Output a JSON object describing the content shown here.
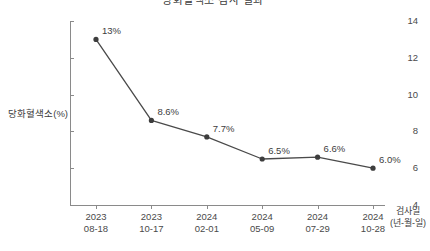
{
  "chart_data": {
    "type": "line",
    "title": "당화혈색소 검사 결과",
    "xlabel": "검사일",
    "xlabel_sub": "(년-월-일)",
    "ylabel": "당화혈색소(%)",
    "ylim": [
      4,
      14
    ],
    "yticks": [
      14,
      12,
      10,
      8,
      6,
      4
    ],
    "ytick_labels": [
      "14",
      "12",
      "10",
      "8",
      "6",
      "4"
    ],
    "grid": false,
    "legend": "none",
    "categories": [
      {
        "year": "2023",
        "md": "08-18"
      },
      {
        "year": "2023",
        "md": "10-17"
      },
      {
        "year": "2024",
        "md": "02-01"
      },
      {
        "year": "2024",
        "md": "05-09"
      },
      {
        "year": "2024",
        "md": "07-29"
      },
      {
        "year": "2024",
        "md": "10-28"
      }
    ],
    "values": [
      13.0,
      8.6,
      7.7,
      6.5,
      6.6,
      6.0
    ],
    "point_labels": [
      "13%",
      "8.6%",
      "7.7%",
      "6.5%",
      "6.6%",
      "6.0%"
    ],
    "series_color": "#4a4a4a",
    "marker_color": "#3d3d3d",
    "axis_color": "#8a8a8a"
  }
}
